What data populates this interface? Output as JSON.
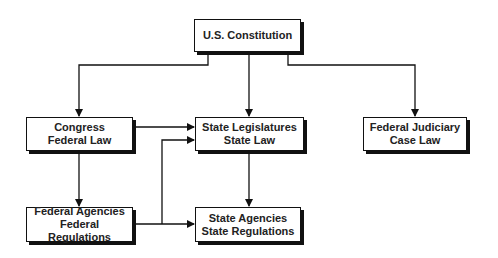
{
  "diagram": {
    "nodes": [
      {
        "id": "constitution",
        "lines": [
          "U.S. Constitution"
        ]
      },
      {
        "id": "congress",
        "lines": [
          "Congress",
          "Federal Law"
        ]
      },
      {
        "id": "state_leg",
        "lines": [
          "State Legislatures",
          "State Law"
        ]
      },
      {
        "id": "judiciary",
        "lines": [
          "Federal Judiciary",
          "Case Law"
        ]
      },
      {
        "id": "fed_agencies",
        "lines": [
          "Federal Agencies",
          "Federal Regulations"
        ]
      },
      {
        "id": "state_agencies",
        "lines": [
          "State Agencies",
          "State Regulations"
        ]
      }
    ],
    "edges": [
      {
        "from": "constitution",
        "to": "congress"
      },
      {
        "from": "constitution",
        "to": "state_leg"
      },
      {
        "from": "constitution",
        "to": "judiciary"
      },
      {
        "from": "congress",
        "to": "state_leg"
      },
      {
        "from": "congress",
        "to": "fed_agencies"
      },
      {
        "from": "fed_agencies",
        "to": "state_leg"
      },
      {
        "from": "fed_agencies",
        "to": "state_agencies"
      },
      {
        "from": "state_leg",
        "to": "state_agencies"
      }
    ],
    "colors": {
      "line": "#111111",
      "box_fill": "#ffffff",
      "text": "#222222"
    }
  }
}
